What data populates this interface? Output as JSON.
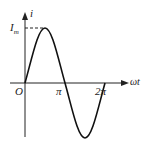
{
  "diagram": {
    "type": "sine-wave",
    "labels": {
      "y_axis": "i",
      "x_axis": "ωt",
      "origin": "O",
      "peak": "I",
      "peak_sub": "m",
      "pi": "π",
      "two_pi": "2π"
    },
    "colors": {
      "stroke": "#111111",
      "background": "#ffffff"
    }
  }
}
